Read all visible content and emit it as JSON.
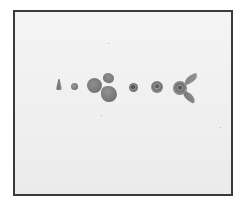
{
  "image": {
    "description": "Black-and-white photograph of sequential stages of forming a clay rose, laid out left to right on a white surface inside a thin dark frame",
    "frame_color": "#3a3a3a",
    "background_color": "#f0f0f0",
    "object_color": "#7a7a7a",
    "objects": [
      {
        "name": "cone",
        "label": "Clay cone"
      },
      {
        "name": "ball",
        "label": "Small clay ball"
      },
      {
        "name": "flat-disc",
        "label": "Flattened disc"
      },
      {
        "name": "petal-top",
        "label": "Petal"
      },
      {
        "name": "petal-bottom",
        "label": "Petal"
      },
      {
        "name": "rolled-bud",
        "label": "Rolled bud"
      },
      {
        "name": "small-rose",
        "label": "Small rose"
      },
      {
        "name": "rose-with-leaves",
        "label": "Finished rose with two leaves"
      }
    ]
  }
}
